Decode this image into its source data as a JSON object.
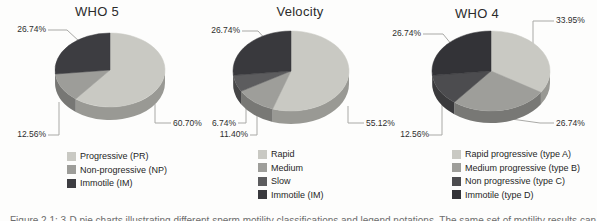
{
  "figure": {
    "caption": "Figure 2.1: 3-D pie charts illustrating different sperm motility classifications and legend notations. The same set of motility results can be"
  },
  "chart_data": [
    {
      "type": "pie",
      "title": "WHO 5",
      "legend_position": "bottom",
      "labels": [
        "Progressive (PR)",
        "Non-progressive (NP)",
        "Immotile (IM)"
      ],
      "values": [
        60.7,
        12.56,
        26.74
      ],
      "value_labels": [
        "60.70%",
        "12.56%",
        "26.74%"
      ],
      "colors": [
        "#c9c9c3",
        "#9d9d99",
        "#3d3d41"
      ]
    },
    {
      "type": "pie",
      "title": "Velocity",
      "legend_position": "bottom",
      "labels": [
        "Rapid",
        "Medium",
        "Slow",
        "Immotile (IM)"
      ],
      "values": [
        55.12,
        11.4,
        6.74,
        26.74
      ],
      "value_labels": [
        "55.12%",
        "11.40%",
        "6.74%",
        "26.74%"
      ],
      "colors": [
        "#c9c9c3",
        "#9e9e9a",
        "#5c5c5e",
        "#39393d"
      ]
    },
    {
      "type": "pie",
      "title": "WHO 4",
      "legend_position": "bottom",
      "labels": [
        "Rapid progressive (type A)",
        "Medium progressive (type B)",
        "Non progressive (type C)",
        "Immotile (type D)"
      ],
      "values": [
        33.95,
        26.74,
        12.56,
        26.74
      ],
      "value_labels": [
        "33.95%",
        "26.74%",
        "12.56%",
        "26.74%"
      ],
      "colors": [
        "#c9c9c3",
        "#9e9e9a",
        "#4c4c4f",
        "#333337"
      ]
    }
  ]
}
